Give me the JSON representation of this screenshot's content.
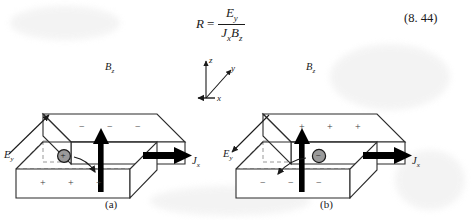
{
  "equation": {
    "lhs": "R",
    "equals": "=",
    "numerator_base": "E",
    "numerator_sub": "y",
    "denominator_first_base": "J",
    "denominator_first_sub": "x",
    "denominator_second_base": "B",
    "denominator_second_sub": "z",
    "number": "(8. 44)"
  },
  "axes": {
    "z_label": "z",
    "y_label": "y",
    "x_label": "x"
  },
  "figures": [
    {
      "id": "a",
      "caption": "(a)",
      "magnetic_field_label_base": "B",
      "magnetic_field_label_sub": "z",
      "electric_field_label_base": "E",
      "electric_field_label_sub": "y",
      "current_label_base": "J",
      "current_label_sub": "x",
      "carrier_sign": "+",
      "top_face_signs": [
        "−",
        "−",
        "−"
      ],
      "front_face_signs": [
        "+",
        "+",
        "+"
      ],
      "e_arrow_direction": "up-right",
      "force_arrow_direction": "down-right"
    },
    {
      "id": "b",
      "caption": "(b)",
      "magnetic_field_label_base": "B",
      "magnetic_field_label_sub": "z",
      "electric_field_label_base": "E",
      "electric_field_label_sub": "y",
      "current_label_base": "J",
      "current_label_sub": "x",
      "carrier_sign": "−",
      "top_face_signs": [
        "+",
        "+",
        "+"
      ],
      "front_face_signs": [
        "−",
        "−",
        "−"
      ],
      "e_arrow_direction": "down-left",
      "force_arrow_direction": "down-left"
    }
  ],
  "colors": {
    "ink": "#1a1a1a",
    "slab_edge": "#2b2b2b",
    "hidden_edge": "#8c8c8c",
    "carrier_fill": "#9a9a9a",
    "arrow_black": "#000000",
    "paper": "#ffffff"
  }
}
